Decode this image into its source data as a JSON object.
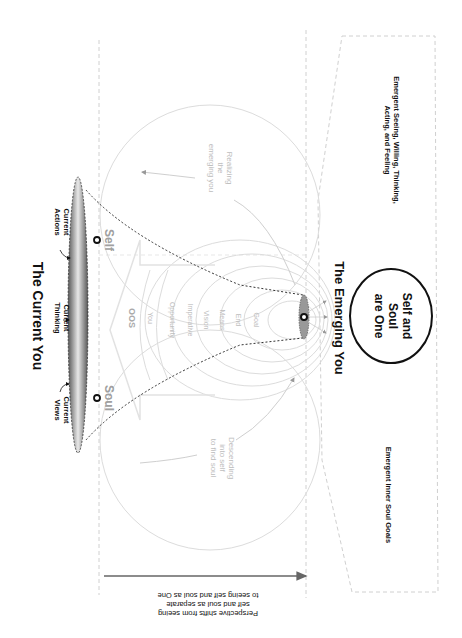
{
  "diagram": {
    "title_current": "The Current You",
    "title_emerging": "The Emerging You",
    "current_labels": {
      "views": [
        "Current",
        "Views"
      ],
      "thinking": [
        "Current",
        "Thinking"
      ],
      "actions": [
        "Current",
        "Actions"
      ]
    },
    "poles": {
      "soul": "Soul",
      "self": "Self"
    },
    "inner_labels": [
      "OOS",
      "You",
      "Opportunity",
      "Imperative",
      "Vision",
      "Means",
      "End",
      "Goal"
    ],
    "process_labels": {
      "realizing": [
        "Realizing",
        "the",
        "emerging you"
      ],
      "descending": [
        "Descending",
        "into self",
        "to find soul"
      ]
    },
    "oneness": [
      "Self and",
      "Soul",
      "are One"
    ],
    "emergent_top": [
      "Emergent Seeing, Willing, Thinking,",
      "Acting, and Feeling"
    ],
    "emergent_bottom": "Emergent Inner Soul Goals",
    "perspective": [
      "Perspective shifts from seeing",
      "self and soul as separate",
      "to seeing self and soul as One"
    ],
    "colors": {
      "text": "#111111",
      "faint": "#bdbdbd",
      "guide": "#d0d0d0",
      "arrow": "#666666"
    }
  }
}
